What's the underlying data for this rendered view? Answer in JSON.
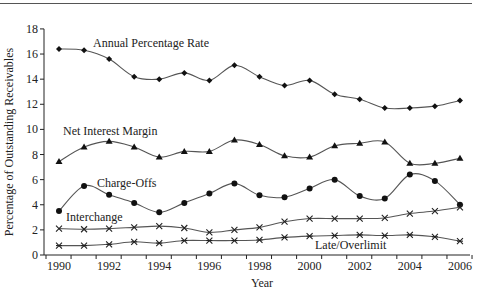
{
  "chart_data": {
    "type": "line",
    "title": "",
    "xlabel": "Year",
    "ylabel": "Percentage of Outstanding Receivables",
    "x": [
      1990,
      1991,
      1992,
      1993,
      1994,
      1995,
      1996,
      1997,
      1998,
      1999,
      2000,
      2001,
      2002,
      2003,
      2004,
      2005,
      2006
    ],
    "xticks": [
      1990,
      1992,
      1994,
      1996,
      1998,
      2000,
      2002,
      2004,
      2006
    ],
    "yticks": [
      0,
      2,
      4,
      6,
      8,
      10,
      12,
      14,
      16,
      18
    ],
    "xlim": [
      1990,
      2006
    ],
    "ylim": [
      0,
      18
    ],
    "grid": false,
    "legend": "inline labels",
    "series": [
      {
        "name": "Annual Percentage Rate",
        "marker": "diamond",
        "values": [
          16.4,
          16.3,
          15.6,
          14.2,
          14.0,
          14.5,
          13.9,
          15.1,
          14.2,
          13.5,
          13.9,
          12.8,
          12.4,
          11.7,
          11.7,
          11.85,
          12.3
        ],
        "label_pos": [
          93,
          47
        ]
      },
      {
        "name": "Net Interest Margin",
        "marker": "triangle",
        "values": [
          7.45,
          8.6,
          9.05,
          8.6,
          7.8,
          8.25,
          8.25,
          9.15,
          8.8,
          7.9,
          7.8,
          8.7,
          8.9,
          9.0,
          7.3,
          7.3,
          7.7
        ],
        "label_pos": [
          63,
          135
        ]
      },
      {
        "name": "Charge-Offs",
        "marker": "circle",
        "values": [
          3.5,
          5.5,
          4.8,
          4.15,
          3.4,
          4.15,
          4.9,
          5.7,
          4.75,
          4.6,
          5.3,
          6.0,
          4.7,
          4.5,
          6.4,
          5.9,
          4.0
        ],
        "label_pos": [
          97,
          187
        ]
      },
      {
        "name": "Interchange",
        "marker": "x",
        "values": [
          2.1,
          2.05,
          2.1,
          2.2,
          2.3,
          2.15,
          1.8,
          2.0,
          2.2,
          2.65,
          2.9,
          2.9,
          2.9,
          2.95,
          3.3,
          3.5,
          3.8
        ],
        "label_pos": [
          66,
          221
        ]
      },
      {
        "name": "Late/Overlimit",
        "marker": "asterisk",
        "values": [
          0.75,
          0.75,
          0.85,
          1.05,
          0.95,
          1.15,
          1.15,
          1.15,
          1.2,
          1.4,
          1.5,
          1.55,
          1.6,
          1.55,
          1.6,
          1.45,
          1.1
        ],
        "label_pos": [
          315,
          249
        ]
      }
    ]
  }
}
